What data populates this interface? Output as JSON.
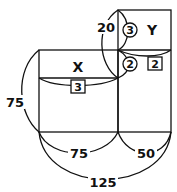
{
  "diagram": {
    "boxes": [
      {
        "id": "X",
        "label": "X",
        "sub_value": "3",
        "width_label": "75",
        "height_label": "75"
      },
      {
        "id": "Y",
        "label": "Y",
        "circled_value": "3",
        "sub_value": "2",
        "width_label": "50"
      }
    ],
    "labels": {
      "top_arc": "20",
      "left_arc": "75",
      "x_label": "X",
      "x_box_value": "3",
      "y_label": "Y",
      "y_circle_value": "3",
      "mid_circle_value": "2",
      "y_box_value": "2",
      "bottom_left": "75",
      "bottom_right": "50",
      "bottom_total": "125"
    },
    "colors": {
      "stroke": "#111111",
      "background": "#ffffff"
    }
  }
}
